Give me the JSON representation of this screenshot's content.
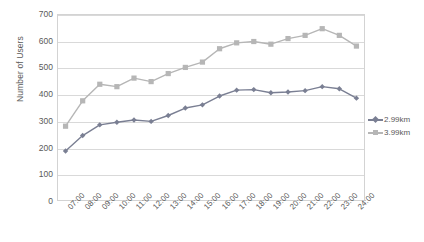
{
  "chart_data": {
    "type": "line",
    "title": "",
    "xlabel": "",
    "ylabel": "Number of Users",
    "ylim": [
      0,
      700
    ],
    "ytick_step": 100,
    "yticks": [
      0,
      100,
      200,
      300,
      400,
      500,
      600,
      700
    ],
    "grid": "horizontal",
    "legend_position": "right",
    "categories": [
      "07:00",
      "08:00",
      "09:00",
      "10:00",
      "11:00",
      "12:00",
      "13:00",
      "14:00",
      "15:00",
      "16:00",
      "17:00",
      "18:00",
      "19:00",
      "20:00",
      "21:00",
      "22:00",
      "23:00",
      "24:00"
    ],
    "series": [
      {
        "name": "2.99km",
        "color": "#7a7f93",
        "marker": "diamond",
        "values": [
          187,
          245,
          285,
          295,
          303,
          298,
          320,
          348,
          360,
          393,
          415,
          417,
          405,
          408,
          413,
          428,
          420,
          385
        ]
      },
      {
        "name": "3.99km",
        "color": "#b6b6b6",
        "marker": "square",
        "values": [
          280,
          375,
          437,
          428,
          460,
          447,
          477,
          500,
          520,
          570,
          592,
          597,
          587,
          608,
          620,
          645,
          620,
          580
        ]
      }
    ]
  },
  "axes": {
    "y_title": "Number of Users"
  },
  "legend": {
    "items": [
      {
        "label": "2.99km"
      },
      {
        "label": "3.99km"
      }
    ]
  }
}
